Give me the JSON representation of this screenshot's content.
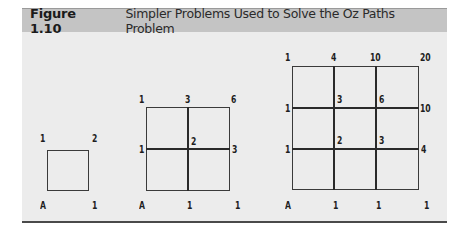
{
  "figure": {
    "label": "Figure 1.10",
    "title": "Simpler Problems Used to Solve the Oz Paths Problem"
  },
  "diagrams": [
    {
      "name": "1x1 grid",
      "top_labels": [
        "1",
        "2"
      ],
      "bottom_labels": [
        "A",
        "1"
      ]
    },
    {
      "name": "2x2 grid",
      "top_labels": [
        "1",
        "3",
        "6"
      ],
      "middle_labels": [
        "1",
        "2",
        "3"
      ],
      "bottom_labels": [
        "A",
        "1",
        "1"
      ]
    },
    {
      "name": "3x3 grid",
      "top_labels": [
        "1",
        "4",
        "10",
        "20"
      ],
      "row1_labels": [
        "1",
        "3",
        "6",
        "10"
      ],
      "row2_labels": [
        "1",
        "2",
        "3",
        "4"
      ],
      "bottom_labels": [
        "A",
        "1",
        "1",
        "1"
      ]
    }
  ]
}
